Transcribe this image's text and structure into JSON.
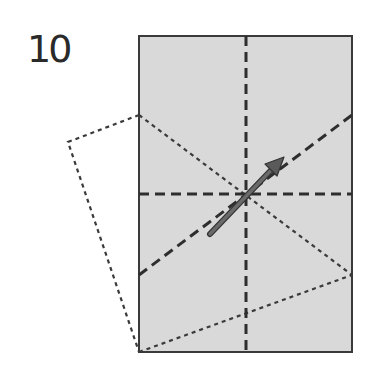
{
  "step": {
    "number": "10"
  },
  "colors": {
    "paper_fill": "#d9d9d9",
    "outline": "#3a3a3a",
    "valley_fold": "#2e2e2e",
    "crease": "#3a3a3a",
    "arrow": "#555555",
    "background": "#ffffff"
  },
  "diagram": {
    "paper": {
      "x": 139,
      "y": 36,
      "width": 213,
      "height": 316
    },
    "dashed_lines": [
      {
        "name": "vertical-center",
        "x1": 246,
        "y1": 36,
        "x2": 246,
        "y2": 352
      },
      {
        "name": "horizontal-center",
        "x1": 139,
        "y1": 194,
        "x2": 352,
        "y2": 194
      },
      {
        "name": "diagonal-fold",
        "x1": 139,
        "y1": 275,
        "x2": 352,
        "y2": 115
      }
    ],
    "dotted_lines": [
      {
        "name": "crease-upper-left-to-right",
        "x1": 139,
        "y1": 115,
        "x2": 352,
        "y2": 275
      },
      {
        "name": "crease-bottom-left-to-right",
        "x1": 139,
        "y1": 352,
        "x2": 352,
        "y2": 275
      }
    ],
    "flap_outline": [
      [
        139,
        115
      ],
      [
        68,
        142
      ],
      [
        139,
        352
      ]
    ],
    "arrow": {
      "x1": 210,
      "y1": 234,
      "x2": 283,
      "y2": 158
    }
  }
}
